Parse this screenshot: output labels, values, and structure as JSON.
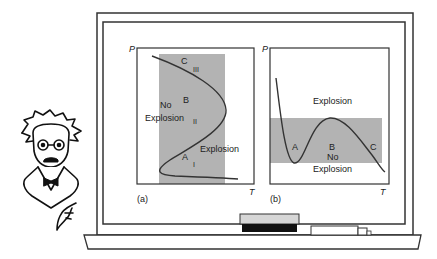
{
  "panel_a": {
    "caption": "(a)",
    "y_axis": "P",
    "x_axis": "T",
    "points": {
      "A": "A",
      "B": "B",
      "C": "C"
    },
    "limits": {
      "first": "I",
      "second": "II",
      "third": "III"
    },
    "region_no_1": "No",
    "region_no_2": "Explosion",
    "region_explosion": "Explosion"
  },
  "panel_b": {
    "caption": "(b)",
    "y_axis": "P",
    "x_axis": "T",
    "points": {
      "A": "A",
      "B": "B",
      "C": "C"
    },
    "region_explosion": "Explosion",
    "region_no_1": "No",
    "region_no_2": "Explosion"
  },
  "colors": {
    "shade": "#b3b3b3",
    "line": "#333333"
  }
}
